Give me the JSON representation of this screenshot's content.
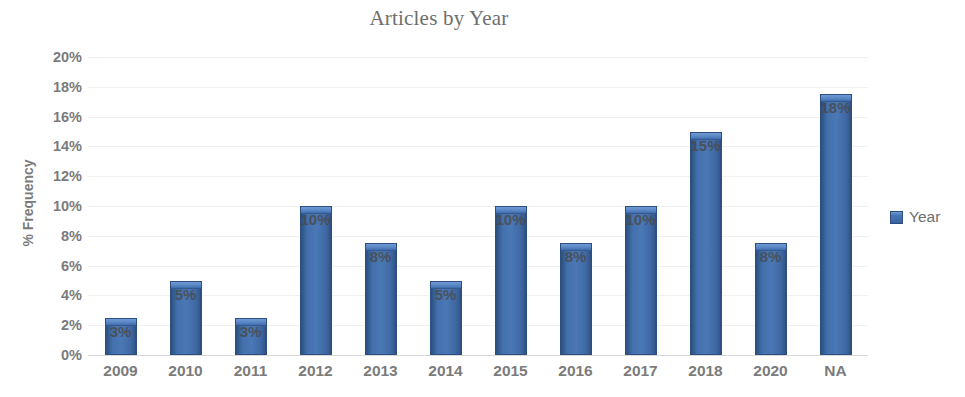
{
  "chart_data": {
    "type": "bar",
    "title": "Articles by Year",
    "xlabel": "",
    "ylabel": "% Frequency",
    "categories": [
      "2009",
      "2010",
      "2011",
      "2012",
      "2013",
      "2014",
      "2015",
      "2016",
      "2017",
      "2018",
      "2020",
      "NA"
    ],
    "values": [
      2.5,
      5.0,
      2.5,
      10.0,
      7.5,
      5.0,
      10.0,
      7.5,
      10.0,
      15.0,
      7.5,
      17.5
    ],
    "data_labels": [
      "3%",
      "5%",
      "3%",
      "10%",
      "8%",
      "5%",
      "10%",
      "8%",
      "10%",
      "15%",
      "8%",
      "18%"
    ],
    "ylim": [
      0,
      20
    ],
    "ytick_values": [
      0,
      2,
      4,
      6,
      8,
      10,
      12,
      14,
      16,
      18,
      20
    ],
    "ytick_labels": [
      "0%",
      "2%",
      "4%",
      "6%",
      "8%",
      "10%",
      "12%",
      "14%",
      "16%",
      "18%",
      "20%"
    ],
    "grid": true,
    "legend_position": "right",
    "series": [
      {
        "name": "Year",
        "values": [
          2.5,
          5.0,
          2.5,
          10.0,
          7.5,
          5.0,
          10.0,
          7.5,
          10.0,
          15.0,
          7.5,
          17.5
        ]
      }
    ],
    "colors": {
      "bar_fill": "#4471ae",
      "bar_edge": "#2c4f7f",
      "bar_cap": "#6f9ad4",
      "gridline": "#f0f0f0",
      "baseline": "#d8d8d8",
      "text": "#7b7b7b",
      "title_text": "#6e6e6e",
      "data_label_text": "#4a4a4a"
    }
  },
  "legend": {
    "swatch_icon": "legend-square-icon",
    "entries": [
      {
        "label": "Year"
      }
    ]
  }
}
